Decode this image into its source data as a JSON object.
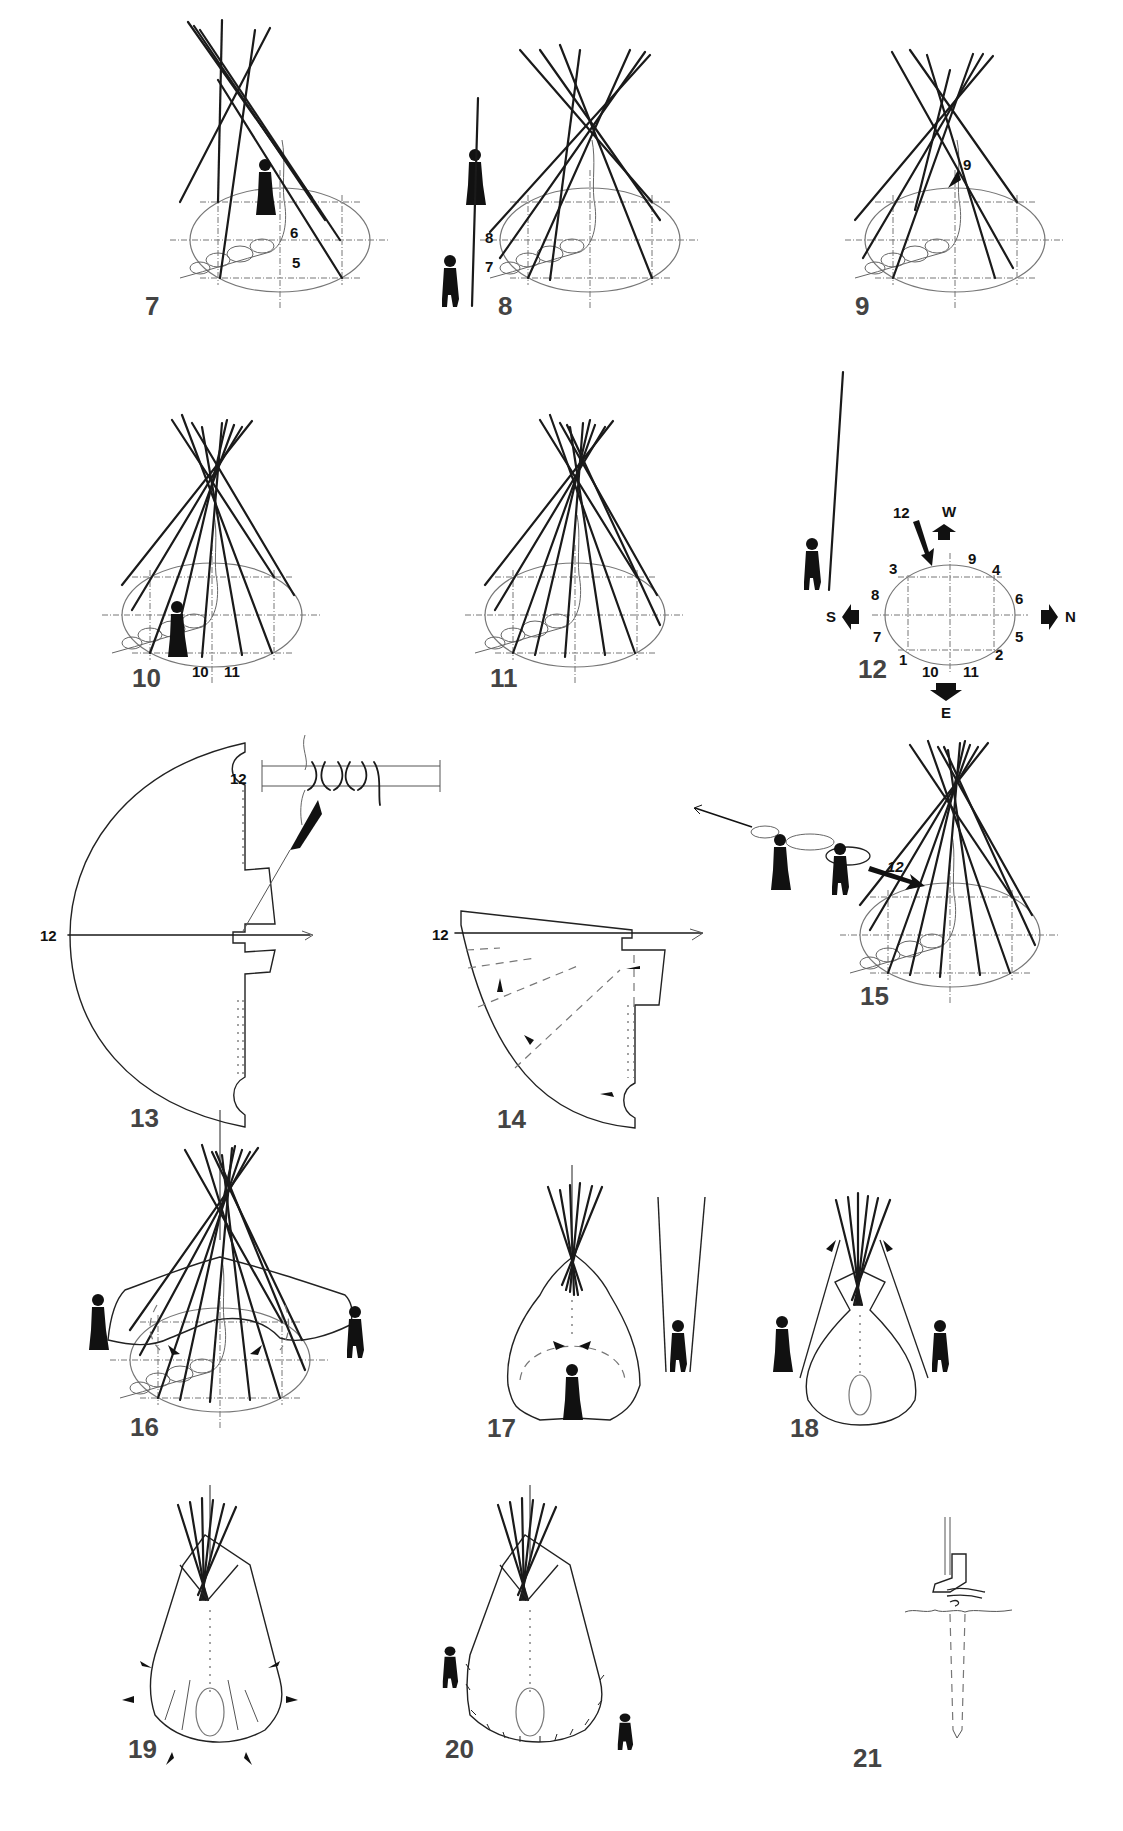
{
  "diagram": {
    "background": "#ffffff",
    "ink_color": "#1a1a1a",
    "steps": [
      {
        "number": "7",
        "labels": [
          "6",
          "5"
        ]
      },
      {
        "number": "8",
        "labels": [
          "8",
          "7"
        ]
      },
      {
        "number": "9",
        "labels": [
          "9"
        ]
      },
      {
        "number": "10",
        "labels": [
          "10",
          "11"
        ]
      },
      {
        "number": "11",
        "labels": []
      },
      {
        "number": "12",
        "labels": [
          "12",
          "W",
          "3",
          "9",
          "4",
          "8",
          "6",
          "S",
          "N",
          "7",
          "5",
          "1",
          "10",
          "11",
          "2",
          "E"
        ]
      },
      {
        "number": "13",
        "labels": [
          "12",
          "12"
        ]
      },
      {
        "number": "14",
        "labels": [
          "12"
        ]
      },
      {
        "number": "15",
        "labels": [
          "12"
        ]
      },
      {
        "number": "16",
        "labels": []
      },
      {
        "number": "17",
        "labels": []
      },
      {
        "number": "18",
        "labels": []
      },
      {
        "number": "19",
        "labels": []
      },
      {
        "number": "20",
        "labels": []
      },
      {
        "number": "21",
        "labels": []
      }
    ],
    "compass": {
      "west": "W",
      "south": "S",
      "north": "N",
      "east": "E"
    },
    "pole_positions": {
      "p1": "1",
      "p2": "2",
      "p3": "3",
      "p4": "4",
      "p5": "5",
      "p6": "6",
      "p7": "7",
      "p8": "8",
      "p9": "9",
      "p10": "10",
      "p11": "11",
      "p12": "12"
    }
  }
}
